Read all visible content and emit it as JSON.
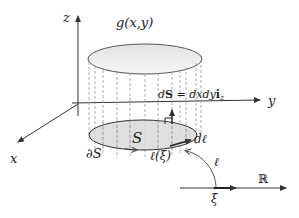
{
  "diagram": {
    "type": "surface-integral-illustration",
    "axes": {
      "x_label": "x",
      "y_label": "y",
      "z_label": "z"
    },
    "labels": {
      "top_surface": "g(x,y)",
      "surface_element_d": "d",
      "surface_element_S": "S",
      "surface_element_eq": " = dxdy",
      "surface_element_i": "i",
      "surface_element_sub": "z",
      "region": "S",
      "boundary": "∂S",
      "line_element": "dℓ",
      "curve_param": "ℓ(ξ)",
      "curve_map": "ℓ",
      "real_line": "ℝ",
      "parameter": "ξ"
    },
    "colors": {
      "ink": "#333333",
      "region_fill": "#d9d9d9",
      "top_fill": "#ececec",
      "dash": "#9a9a9a"
    }
  }
}
